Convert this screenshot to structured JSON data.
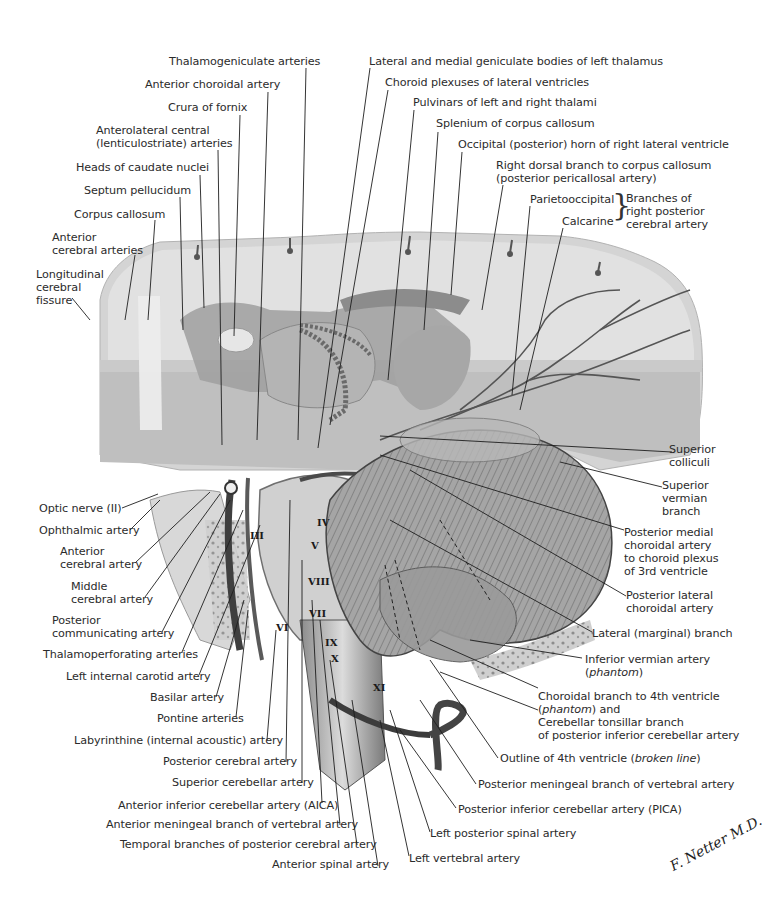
{
  "figure": {
    "style": "grayscale anatomical illustration",
    "signature": "F. Netter M.D."
  },
  "labels_top_left": [
    {
      "id": "thalamogeniculate",
      "text": "Thalamogeniculate arteries"
    },
    {
      "id": "anterior-choroidal",
      "text": "Anterior choroidal artery"
    },
    {
      "id": "crura-fornix",
      "text": "Crura of fornix"
    },
    {
      "id": "anterolateral-central",
      "text": "Anterolateral central",
      "text2": "(lenticulostriate) arteries"
    },
    {
      "id": "heads-caudate",
      "text": "Heads of caudate nuclei"
    },
    {
      "id": "septum-pellucidum",
      "text": "Septum pellucidum"
    },
    {
      "id": "corpus-callosum",
      "text": "Corpus callosum"
    },
    {
      "id": "anterior-cerebral-arteries",
      "text": "Anterior",
      "text2": "cerebral arteries"
    },
    {
      "id": "longitudinal-fissure",
      "text": "Longitudinal",
      "text2": "cerebral",
      "text3": "fissure"
    }
  ],
  "labels_top_right": [
    {
      "id": "geniculate-bodies",
      "text": "Lateral and medial geniculate bodies of left thalamus"
    },
    {
      "id": "choroid-plexuses",
      "text": "Choroid plexuses of lateral ventricles"
    },
    {
      "id": "pulvinars",
      "text": "Pulvinars of left and right thalami"
    },
    {
      "id": "splenium",
      "text": "Splenium of corpus callosum"
    },
    {
      "id": "occipital-horn",
      "text": "Occipital (posterior) horn of right lateral ventricle"
    },
    {
      "id": "right-dorsal-branch",
      "text": "Right dorsal branch to corpus callosum",
      "text2": "(posterior pericallosal artery)"
    },
    {
      "id": "parietooccipital",
      "text": "Parietooccipital"
    },
    {
      "id": "calcarine",
      "text": "Calcarine"
    },
    {
      "id": "branches-group",
      "text": "Branches of",
      "text2": "right posterior",
      "text3": "cerebral artery"
    }
  ],
  "labels_left": [
    {
      "id": "optic-nerve",
      "text": "Optic nerve (II)"
    },
    {
      "id": "ophthalmic",
      "text": "Ophthalmic artery"
    },
    {
      "id": "anterior-cerebral-artery",
      "text": "Anterior",
      "text2": "cerebral artery"
    },
    {
      "id": "middle-cerebral",
      "text": "Middle",
      "text2": "cerebral artery"
    },
    {
      "id": "posterior-communicating",
      "text": "Posterior",
      "text2": "communicating artery"
    },
    {
      "id": "thalamoperforating",
      "text": "Thalamoperforating arteries"
    },
    {
      "id": "left-internal-carotid",
      "text": "Left internal carotid artery"
    },
    {
      "id": "basilar",
      "text": "Basilar artery"
    },
    {
      "id": "pontine",
      "text": "Pontine arteries"
    },
    {
      "id": "labyrinthine",
      "text": "Labyrinthine (internal acoustic) artery"
    },
    {
      "id": "posterior-cerebral",
      "text": "Posterior cerebral artery"
    },
    {
      "id": "superior-cerebellar",
      "text": "Superior cerebellar artery"
    },
    {
      "id": "aica",
      "text": "Anterior inferior cerebellar artery (AICA)"
    },
    {
      "id": "anterior-meningeal",
      "text": "Anterior meningeal branch of vertebral artery"
    },
    {
      "id": "temporal-branches",
      "text": "Temporal branches of posterior cerebral artery"
    },
    {
      "id": "anterior-spinal",
      "text": "Anterior spinal artery"
    }
  ],
  "labels_right": [
    {
      "id": "superior-colliculi",
      "text": "Superior",
      "text2": "colliculi"
    },
    {
      "id": "superior-vermian",
      "text": "Superior",
      "text2": "vermian",
      "text3": "branch"
    },
    {
      "id": "posterior-medial-choroidal",
      "text": "Posterior medial",
      "text2": "choroidal artery",
      "text3": "to choroid plexus",
      "text4": "of 3rd ventricle"
    },
    {
      "id": "posterior-lateral-choroidal",
      "text": "Posterior lateral",
      "text2": "choroidal artery"
    },
    {
      "id": "lateral-marginal",
      "text": "Lateral (marginal) branch"
    },
    {
      "id": "inferior-vermian",
      "text": "Inferior vermian artery",
      "text2_italic": "phantom"
    },
    {
      "id": "choroidal-4th",
      "text": "Choroidal branch to 4th ventricle",
      "text2_italic": "phantom",
      "text2_tail": ") and",
      "text3": "Cerebellar tonsillar branch",
      "text4": "of posterior inferior cerebellar artery"
    },
    {
      "id": "outline-4th",
      "text": "Outline of 4th ventricle (",
      "text_italic": "broken line",
      "text_tail": ")"
    },
    {
      "id": "posterior-meningeal",
      "text": "Posterior meningeal branch of vertebral artery"
    },
    {
      "id": "pica",
      "text": "Posterior inferior cerebellar artery (PICA)"
    },
    {
      "id": "left-posterior-spinal",
      "text": "Left posterior spinal artery"
    },
    {
      "id": "left-vertebral",
      "text": "Left vertebral artery"
    }
  ],
  "cranial_nerve_numerals": [
    "III",
    "IV",
    "V",
    "VI",
    "VII",
    "VIII",
    "IX",
    "X",
    "XI"
  ],
  "colors": {
    "ink": "#2b2b2b",
    "cortex_light": "#d6d6d6",
    "cortex_gray": "#bdbdbd",
    "white_matter": "#e6e6e6",
    "ventricle": "#a9a9a9",
    "cerebellum": "#9a9a9a",
    "dark_vessel": "#4a4a4a",
    "bone": "#c8c8c8"
  }
}
